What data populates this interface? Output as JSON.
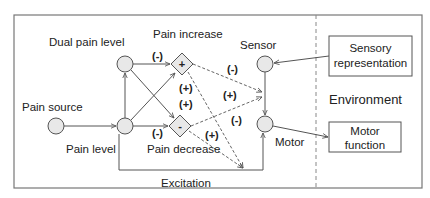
{
  "diagram": {
    "nodes": {
      "pain_source": {
        "label": "Pain source",
        "shape": "circle"
      },
      "pain_level": {
        "label": "Pain level",
        "shape": "circle"
      },
      "dual_pain_level": {
        "label": "Dual pain level",
        "shape": "circle"
      },
      "pain_increase": {
        "label": "Pain increase",
        "shape": "diamond",
        "symbol": "+"
      },
      "pain_decrease": {
        "label": "Pain decrease",
        "shape": "diamond",
        "symbol": "-"
      },
      "sensor": {
        "label": "Sensor",
        "shape": "circle"
      },
      "motor": {
        "label": "Motor",
        "shape": "circle"
      },
      "sensory_representation": {
        "label_line1": "Sensory",
        "label_line2": "representation",
        "shape": "box"
      },
      "motor_function": {
        "label_line1": "Motor",
        "label_line2": "function",
        "shape": "box"
      }
    },
    "region_label": "Environment",
    "excitation_label": "Excitation",
    "edge_signs": {
      "dual_to_increase": "(-)",
      "level_to_increase": "(+)",
      "dual_to_decrease": "(+)",
      "level_to_decrease": "(-)",
      "increase_to_sensor": "(-)",
      "decrease_to_sensor": "(+)",
      "increase_to_motor": "(-)",
      "decrease_to_motor": "(+)"
    },
    "colors": {
      "node_fill": "#e8e8e8",
      "stroke": "#555555",
      "frame": "#777777"
    }
  }
}
